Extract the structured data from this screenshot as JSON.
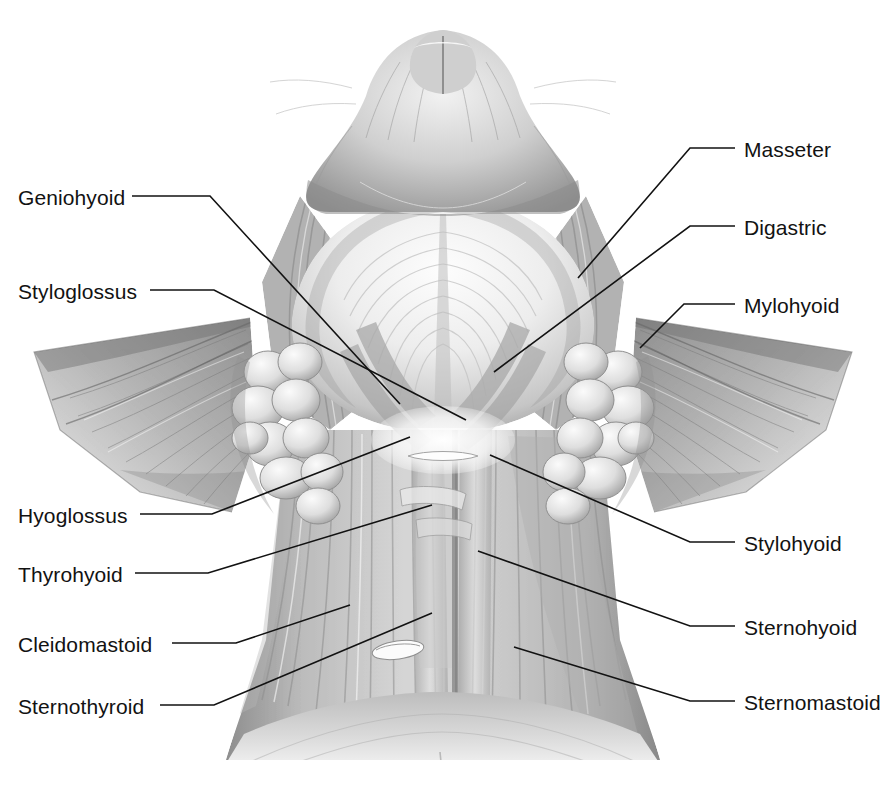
{
  "figure": {
    "style": "grayscale pencil anatomical illustration",
    "background_color": "#ffffff",
    "line_color": "#121212",
    "label_font_px": 21
  },
  "labels_left": [
    {
      "name": "geniohyoid",
      "text": "Geniohyoid",
      "x": 18,
      "y": 203
    },
    {
      "name": "styloglossus",
      "text": "Styloglossus",
      "x": 18,
      "y": 297
    },
    {
      "name": "hyoglossus",
      "text": "Hyoglossus",
      "x": 18,
      "y": 521
    },
    {
      "name": "thyrohyoid",
      "text": "Thyrohyoid",
      "x": 18,
      "y": 580
    },
    {
      "name": "cleidomastoid",
      "text": "Cleidomastoid",
      "x": 18,
      "y": 650
    },
    {
      "name": "sternothyroid",
      "text": "Sternothyroid",
      "x": 18,
      "y": 712
    }
  ],
  "labels_right": [
    {
      "name": "masseter",
      "text": "Masseter",
      "x": 744,
      "y": 155
    },
    {
      "name": "digastric",
      "text": "Digastric",
      "x": 744,
      "y": 233
    },
    {
      "name": "mylohyoid",
      "text": "Mylohyoid",
      "x": 744,
      "y": 311
    },
    {
      "name": "stylohyoid",
      "text": "Stylohyoid",
      "x": 744,
      "y": 549
    },
    {
      "name": "sternohyoid",
      "text": "Sternohyoid",
      "x": 744,
      "y": 633
    },
    {
      "name": "sternomastoid",
      "text": "Sternomastoid",
      "x": 744,
      "y": 708
    }
  ],
  "leaders": [
    {
      "name": "leader-geniohyoid",
      "points": "132,196 210,196 400,404"
    },
    {
      "name": "leader-styloglossus",
      "points": "150,290 214,290 466,420"
    },
    {
      "name": "leader-hyoglossus",
      "points": "140,514 212,514 410,437"
    },
    {
      "name": "leader-thyrohyoid",
      "points": "135,573 208,573 432,505"
    },
    {
      "name": "leader-cleidomastoid",
      "points": "172,643 236,643 350,605"
    },
    {
      "name": "leader-sternothyroid",
      "points": "160,705 214,705 432,613"
    },
    {
      "name": "leader-masseter",
      "points": "735,148 690,148 578,278"
    },
    {
      "name": "leader-digastric",
      "points": "735,226 690,226 494,372"
    },
    {
      "name": "leader-mylohyoid",
      "points": "735,304 684,304 640,348"
    },
    {
      "name": "leader-stylohyoid",
      "points": "735,542 690,542 490,455"
    },
    {
      "name": "leader-sternohyoid",
      "points": "735,626 690,626 478,551"
    },
    {
      "name": "leader-sternomastoid",
      "points": "735,701 690,701 514,647"
    }
  ]
}
